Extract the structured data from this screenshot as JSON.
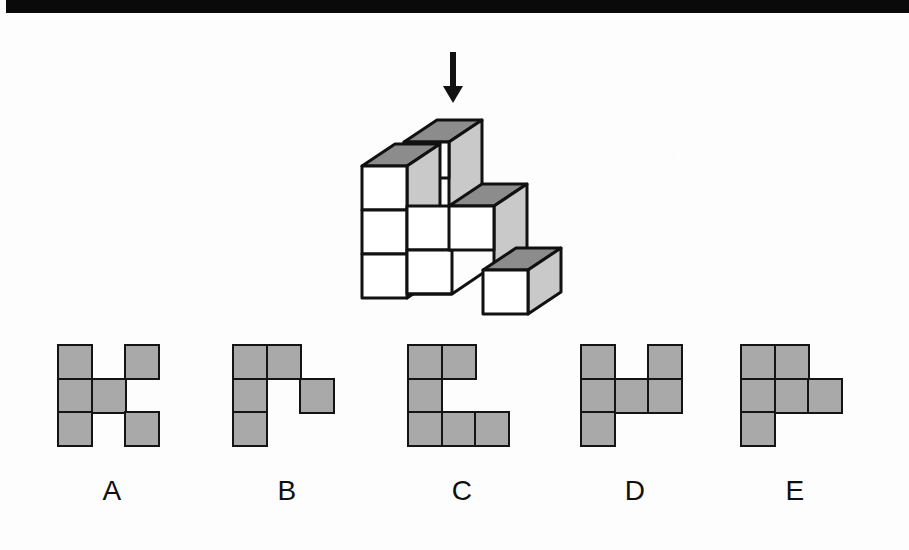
{
  "page": {
    "type": "spatial-reasoning-question",
    "background_color": "#fdfdfd",
    "top_bar_color": "#0a0a0a"
  },
  "prompt": {
    "arrow_icon": "down-arrow-icon",
    "arrow_color": "#111111",
    "arrow_meaning": "view direction from above"
  },
  "figure": {
    "name": "isometric-cube-stack",
    "face_colors": {
      "top": "#8c8c8c",
      "left": "#ffffff",
      "right": "#c9c9c9",
      "outline": "#111111"
    },
    "cube_count": 8
  },
  "options": [
    {
      "id": "A",
      "label": "A",
      "name": "option-a",
      "x": 57,
      "cells": [
        [
          0,
          0
        ],
        [
          2,
          0
        ],
        [
          0,
          1
        ],
        [
          1,
          1
        ],
        [
          0,
          2
        ],
        [
          2,
          2
        ]
      ]
    },
    {
      "id": "B",
      "label": "B",
      "name": "option-b",
      "x": 232,
      "cells": [
        [
          0,
          0
        ],
        [
          1,
          0
        ],
        [
          0,
          1
        ],
        [
          2,
          1
        ],
        [
          0,
          2
        ]
      ]
    },
    {
      "id": "C",
      "label": "C",
      "name": "option-c",
      "x": 407,
      "cells": [
        [
          0,
          0
        ],
        [
          1,
          0
        ],
        [
          0,
          1
        ],
        [
          0,
          2
        ],
        [
          1,
          2
        ],
        [
          2,
          2
        ]
      ]
    },
    {
      "id": "D",
      "label": "D",
      "name": "option-d",
      "x": 580,
      "cells": [
        [
          0,
          0
        ],
        [
          2,
          0
        ],
        [
          0,
          1
        ],
        [
          1,
          1
        ],
        [
          2,
          1
        ],
        [
          0,
          2
        ]
      ]
    },
    {
      "id": "E",
      "label": "E",
      "name": "option-e",
      "x": 740,
      "cells": [
        [
          0,
          0
        ],
        [
          1,
          0
        ],
        [
          0,
          1
        ],
        [
          1,
          1
        ],
        [
          2,
          1
        ],
        [
          0,
          2
        ]
      ]
    }
  ],
  "style": {
    "cell_fill": "#a9a9a9",
    "cell_stroke": "#141414",
    "cell_size_px": 36,
    "label_color": "#101010"
  }
}
